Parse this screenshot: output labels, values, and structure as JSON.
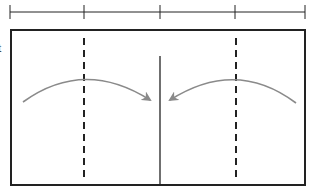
{
  "diagram": {
    "edge_label_fragment": "t",
    "colors": {
      "stroke": "#222222",
      "arrow": "#8a8a8a",
      "background": "#ffffff"
    },
    "ruler": {
      "y": 12,
      "x_start": 10,
      "x_end": 305,
      "ticks": [
        10,
        84,
        160,
        235,
        305
      ],
      "tick_half_height": 7
    },
    "frame": {
      "x": 11,
      "y": 30,
      "width": 294,
      "height": 155
    },
    "center_line": {
      "x": 160,
      "y1": 56,
      "y2": 185
    },
    "dashed_lines": [
      {
        "x": 84,
        "y1": 38,
        "y2": 177
      },
      {
        "x": 236,
        "y1": 38,
        "y2": 177
      }
    ],
    "arrows": [
      {
        "name": "left-arc-arrow",
        "path": "M23,102 Q84,58 150,100",
        "tip": [
          156,
          104
        ],
        "direction": "right"
      },
      {
        "name": "right-arc-arrow",
        "path": "M296,103 Q236,58 170,100",
        "tip": [
          164,
          104
        ],
        "direction": "left"
      }
    ]
  }
}
